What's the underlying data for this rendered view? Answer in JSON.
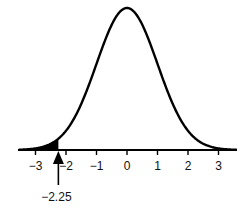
{
  "chart_data": {
    "type": "area",
    "title": "",
    "xlabel": "",
    "ylabel": "",
    "x_ticks": [
      -3,
      -2,
      -1,
      0,
      1,
      2,
      3
    ],
    "x_tick_labels": [
      "−3",
      "−2",
      "−1",
      "0",
      "1",
      "2",
      "3"
    ],
    "xlim": [
      -3.5,
      3.5
    ],
    "grid": false,
    "legend": null,
    "series": [
      {
        "name": "normal-density",
        "distribution": "normal",
        "mean": 0,
        "sd": 1
      }
    ],
    "shaded_region": {
      "from": "-inf",
      "to": -2.25,
      "color": "#000000"
    },
    "annotations": [
      {
        "type": "arrow",
        "x": -2.25,
        "label": "−2.25"
      }
    ]
  },
  "colors": {
    "curve": "#000000",
    "axis": "#000000",
    "shade": "#000000",
    "background": "#ffffff"
  }
}
